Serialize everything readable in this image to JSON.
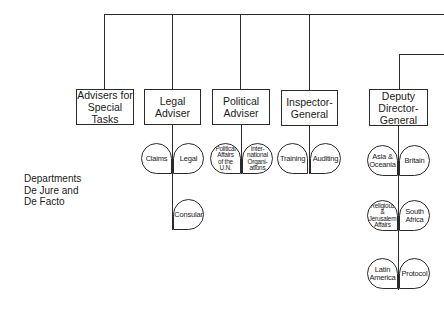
{
  "chart": {
    "title": "",
    "side_label": "Departments\nDe Jure and\nDe Facto",
    "top_units": [
      {
        "label": "Advisers for\nSpecial Tasks"
      },
      {
        "label": "Legal\nAdviser"
      },
      {
        "label": "Political\nAdviser"
      },
      {
        "label": "Inspector-\nGeneral"
      },
      {
        "label": "Deputy\nDirector-\nGeneral"
      }
    ],
    "departments": {
      "legal": [
        "Claims",
        "Legal",
        "Consular"
      ],
      "political": [
        "Political\nAffairs\nof the\nU.N.",
        "Inter-\nnational\nOrgani-\nations"
      ],
      "inspector": [
        "Training",
        "Auditing"
      ],
      "deputy": [
        "Asia &\nOceania",
        "Britain",
        "Religious\n&\nJerusalem\nAffairs",
        "South\nAfrica",
        "Latin\nAmerica",
        "Protocol"
      ]
    }
  }
}
